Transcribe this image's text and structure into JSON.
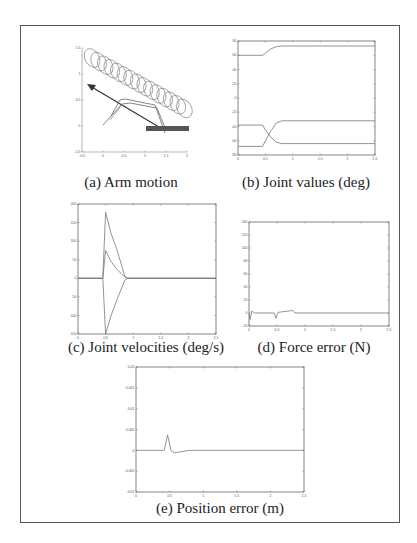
{
  "figure": {
    "border_color": "#555555",
    "line_color": "#777777"
  },
  "chart_data": [
    {
      "id": "a",
      "type": "line",
      "title": "(a) Arm motion",
      "xlabel": "",
      "ylabel": "",
      "xticks": [
        "-0.5",
        "0",
        "0.5",
        "1",
        "1.5",
        "2"
      ],
      "yticks": [
        "1.5",
        "1",
        "0.5",
        "0",
        "-0.5"
      ],
      "description": "Robot arm motion diagram: diagonal coil of ellipses (hose/trajectory), diagonal arrow pointing up-left, arm link configurations, dark horizontal bar (surface)",
      "grid": false
    },
    {
      "id": "b",
      "type": "line",
      "title": "(b) Joint values (deg)",
      "xlabel": "",
      "ylabel": "",
      "xlim": [
        0,
        2.5
      ],
      "ylim": [
        -80,
        80
      ],
      "xticks": [
        "0",
        "0.5",
        "1",
        "1.5",
        "2",
        "2.5"
      ],
      "yticks": [
        "80",
        "60",
        "40",
        "20",
        "0",
        "-20",
        "-40",
        "-60",
        "-80"
      ],
      "x": [
        0,
        0.45,
        0.5,
        0.6,
        0.7,
        0.8,
        2.5
      ],
      "series": [
        {
          "name": "joint 1",
          "values": [
            60,
            60,
            63,
            69,
            72,
            73,
            73
          ]
        },
        {
          "name": "joint 2",
          "values": [
            -38,
            -38,
            -45,
            -55,
            -62,
            -64,
            -64
          ]
        },
        {
          "name": "joint 3",
          "values": [
            -68,
            -68,
            -60,
            -46,
            -35,
            -32,
            -32
          ]
        }
      ],
      "grid": false
    },
    {
      "id": "c",
      "type": "line",
      "title": "(c) Joint velocities (deg/s)",
      "xlabel": "",
      "ylabel": "",
      "xlim": [
        0,
        2.5
      ],
      "ylim": [
        -150,
        200
      ],
      "xticks": [
        "0",
        "0.5",
        "1",
        "1.5",
        "2",
        "2.5"
      ],
      "yticks": [
        "200",
        "150",
        "100",
        "50",
        "0",
        "-50",
        "-100",
        "-150"
      ],
      "x": [
        0,
        0.45,
        0.5,
        0.6,
        0.7,
        0.85,
        0.9,
        2.5
      ],
      "series": [
        {
          "name": "joint 1",
          "values": [
            0,
            0,
            178,
            120,
            80,
            5,
            0,
            0
          ]
        },
        {
          "name": "joint 2",
          "values": [
            0,
            0,
            75,
            45,
            25,
            3,
            0,
            0
          ]
        },
        {
          "name": "joint 3",
          "values": [
            0,
            0,
            -150,
            -100,
            -60,
            -5,
            0,
            0
          ]
        }
      ],
      "grid": false
    },
    {
      "id": "d",
      "type": "line",
      "title": "(d) Force error (N)",
      "xlabel": "",
      "ylabel": "",
      "xlim": [
        0,
        2.5
      ],
      "ylim": [
        -20,
        140
      ],
      "xticks": [
        "0",
        "0.5",
        "1",
        "1.5",
        "2",
        "2.5"
      ],
      "yticks": [
        "140",
        "120",
        "100",
        "80",
        "60",
        "40",
        "20",
        "0",
        "-20"
      ],
      "x": [
        0,
        0.02,
        0.05,
        0.1,
        0.45,
        0.48,
        0.52,
        0.6,
        0.7,
        0.78,
        0.82,
        2.5
      ],
      "series": [
        {
          "name": "force error",
          "values": [
            0,
            -10,
            3,
            0,
            0,
            -8,
            1,
            2,
            3,
            4,
            0,
            0
          ]
        }
      ],
      "grid": false
    },
    {
      "id": "e",
      "type": "line",
      "title": "(e) Position error (m)",
      "xlabel": "",
      "ylabel": "",
      "xlim": [
        0,
        2.5
      ],
      "ylim": [
        -0.01,
        0.02
      ],
      "xticks": [
        "0",
        "0.5",
        "1",
        "1.5",
        "2",
        "2.5"
      ],
      "yticks": [
        "0.02",
        "0.015",
        "0.01",
        "0.005",
        "0",
        "-0.005",
        "-0.01"
      ],
      "x": [
        0,
        0.42,
        0.47,
        0.52,
        0.57,
        0.8,
        2.5
      ],
      "series": [
        {
          "name": "position error",
          "values": [
            0,
            0,
            0.0037,
            0.0,
            -0.0006,
            0.0,
            0
          ]
        }
      ],
      "grid": false
    }
  ]
}
